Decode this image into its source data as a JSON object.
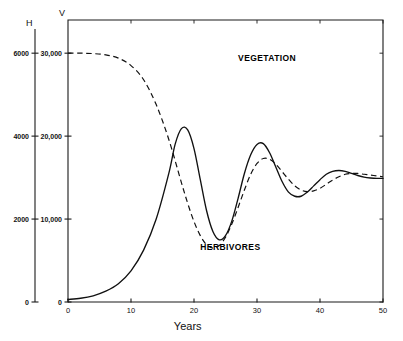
{
  "chart_data": {
    "type": "line",
    "title": "",
    "xlabel": "Years",
    "xlim": [
      0,
      50
    ],
    "grid": false,
    "legend": "inline-annotations",
    "axes": [
      {
        "id": "H",
        "name": "H",
        "side": "outer-left",
        "description": "Herbivore population",
        "ylim": [
          0,
          6800
        ],
        "ticks": [
          0,
          2000,
          4000,
          6000
        ],
        "tick_labels": [
          "0",
          "2000",
          "4000",
          "6000"
        ]
      },
      {
        "id": "V",
        "name": "V",
        "side": "inner-left",
        "description": "Vegetation biomass",
        "ylim": [
          0,
          34000
        ],
        "ticks": [
          0,
          10000,
          20000,
          30000
        ],
        "tick_labels": [
          "0",
          "10,000",
          "20,000",
          "30,000"
        ]
      }
    ],
    "x_ticks": [
      0,
      10,
      20,
      30,
      40,
      50
    ],
    "x_tick_labels": [
      "0",
      "10",
      "20",
      "30",
      "40",
      "50"
    ],
    "series": [
      {
        "name": "VEGETATION",
        "axis": "V",
        "style": "dashed",
        "label_x": 27,
        "label_y": 29000,
        "x": [
          0,
          2,
          4,
          6,
          8,
          10,
          12,
          14,
          16,
          18,
          19,
          20,
          21,
          22,
          23,
          24,
          25,
          26,
          27,
          28,
          29,
          30,
          31,
          32,
          33,
          34,
          35,
          36,
          37,
          38,
          39,
          40,
          41,
          42,
          43,
          44,
          45,
          46,
          47,
          48,
          49,
          50
        ],
        "values": [
          30000,
          30000,
          29950,
          29800,
          29400,
          28500,
          26800,
          23800,
          19600,
          14400,
          11900,
          9700,
          8000,
          6900,
          6500,
          6800,
          7800,
          9400,
          11400,
          13500,
          15400,
          16700,
          17300,
          17200,
          16600,
          15700,
          14800,
          14000,
          13500,
          13300,
          13400,
          13700,
          14200,
          14700,
          15100,
          15400,
          15500,
          15500,
          15400,
          15300,
          15200,
          15100
        ]
      },
      {
        "name": "HERBIVORES",
        "axis": "H",
        "style": "solid",
        "label_x": 21,
        "label_y": 1250,
        "x": [
          0,
          2,
          4,
          6,
          8,
          10,
          12,
          14,
          16,
          17,
          18,
          19,
          20,
          21,
          22,
          23,
          24,
          25,
          26,
          27,
          28,
          29,
          30,
          31,
          32,
          33,
          34,
          35,
          36,
          37,
          38,
          39,
          40,
          41,
          42,
          43,
          44,
          45,
          46,
          47,
          48,
          49,
          50
        ],
        "values": [
          60,
          90,
          150,
          260,
          440,
          750,
          1250,
          2000,
          3100,
          3800,
          4180,
          4150,
          3700,
          2950,
          2200,
          1700,
          1500,
          1600,
          1950,
          2500,
          3100,
          3550,
          3800,
          3820,
          3600,
          3250,
          2900,
          2650,
          2550,
          2550,
          2650,
          2800,
          2950,
          3080,
          3150,
          3170,
          3150,
          3100,
          3050,
          3010,
          2990,
          2980,
          2980
        ]
      }
    ]
  },
  "annotations": {
    "vegetation_label": "VEGETATION",
    "herbivores_label": "HERBIVORES",
    "h_axis_letter": "H",
    "v_axis_letter": "V",
    "x_axis_title": "Years"
  },
  "ticks": {
    "h": [
      "6000",
      "4000",
      "2000",
      "0"
    ],
    "v": [
      "30,000",
      "20,000",
      "10,000",
      "0"
    ],
    "x": [
      "0",
      "10",
      "20",
      "30",
      "40",
      "50"
    ]
  },
  "colors": {
    "ink": "#111111",
    "background": "#ffffff"
  }
}
